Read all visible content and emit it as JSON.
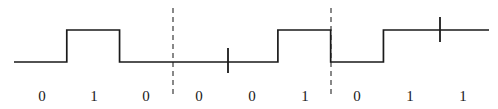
{
  "figure": {
    "name": "nrz-digital-waveform",
    "width": 498,
    "height": 109,
    "background_color": "#ffffff"
  },
  "chart_data": {
    "type": "line",
    "title": "",
    "xlabel": "",
    "ylabel": "",
    "subtype": "digital-waveform-nrz",
    "categories": [
      "0",
      "1",
      "0",
      "0",
      "0",
      "1",
      "0",
      "1",
      "1"
    ],
    "values": [
      0,
      1,
      0,
      0,
      0,
      1,
      0,
      1,
      1
    ],
    "bit_count": 9,
    "levels": {
      "low": 0,
      "high": 1
    },
    "x_start": 14,
    "x_end": 489,
    "bit_period_px": 52.8,
    "y_low_px": 62,
    "y_high_px": 30,
    "transitions_px": [
      66,
      120,
      279,
      331,
      384
    ],
    "grid": false,
    "legend": "none",
    "line_color": "#1a1a1a",
    "line_width": 1.7
  },
  "labels": {
    "row_y": 96,
    "items": [
      {
        "text": "0",
        "x": 42
      },
      {
        "text": "1",
        "x": 94
      },
      {
        "text": "0",
        "x": 146
      },
      {
        "text": "0",
        "x": 199
      },
      {
        "text": "0",
        "x": 252
      },
      {
        "text": "1",
        "x": 305
      },
      {
        "text": "0",
        "x": 357
      },
      {
        "text": "1",
        "x": 410
      },
      {
        "text": "1",
        "x": 463
      }
    ]
  },
  "markers": {
    "dashed_lines": {
      "color": "#6b6b6b",
      "dash_pattern": "5,4",
      "width": 1.6,
      "items": [
        {
          "name": "dashed-divider-1",
          "x": 173,
          "y_top": 8,
          "y_bottom": 96
        },
        {
          "name": "dashed-divider-2",
          "x": 331,
          "y_top": 8,
          "y_bottom": 96
        }
      ]
    },
    "ticks": {
      "color": "#1a1a1a",
      "width": 1.8,
      "items": [
        {
          "name": "tick-mark-low",
          "x": 228,
          "y_top": 48,
          "y_bottom": 73
        },
        {
          "name": "tick-mark-high",
          "x": 440,
          "y_top": 17,
          "y_bottom": 42
        }
      ]
    }
  }
}
